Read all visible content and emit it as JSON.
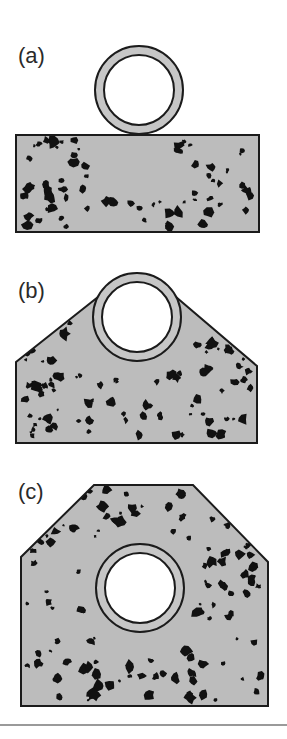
{
  "figure": {
    "type": "cross-section diagram",
    "colors": {
      "concrete_fill": "#bcbcbc",
      "ring_fill": "#c6c6c6",
      "stroke": "#1b1b1b",
      "aggregate": "#111111",
      "bore": "#ffffff",
      "divider": "#9a9a9a"
    },
    "panels": [
      {
        "id": "a",
        "label": "(a)",
        "label_pos": [
          18,
          63
        ],
        "shape": "rectangle base with pipe resting on top",
        "outline": "16,135 259,135 259,232 16,232",
        "pipe": {
          "cx": 139,
          "cy": 90,
          "r_outer": 44,
          "r_inner": 35
        }
      },
      {
        "id": "b",
        "label": "(b)",
        "label_pos": [
          18,
          298
        ],
        "shape": "pentagonal haunch partially embedding pipe",
        "outline": "16,362 98,297 176,297 257,366 257,443 16,443",
        "pipe": {
          "cx": 137,
          "cy": 317,
          "r_outer": 44,
          "r_inner": 35
        }
      },
      {
        "id": "c",
        "label": "(c)",
        "label_pos": [
          18,
          499
        ],
        "shape": "full encasement with chamfered top corners",
        "outline": "94,485 193,485 268,562 268,706 21,706 21,557",
        "pipe": {
          "cx": 140,
          "cy": 588,
          "r_outer": 44,
          "r_inner": 35
        }
      }
    ]
  }
}
